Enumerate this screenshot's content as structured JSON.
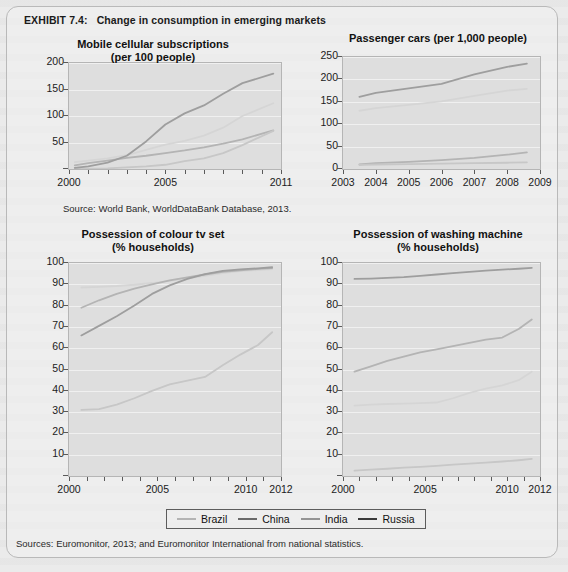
{
  "exhibit": {
    "number": "EXHIBIT 7.4:",
    "title": "Change in consumption in emerging markets"
  },
  "legend": {
    "items": [
      {
        "label": "Brazil",
        "color": "#b4b4b4"
      },
      {
        "label": "China",
        "color": "#6a6a6a"
      },
      {
        "label": "India",
        "color": "#949494"
      },
      {
        "label": "Russia",
        "color": "#3a3a3a"
      }
    ]
  },
  "sources": {
    "top": "Source: World Bank, WorldDataBank Database, 2013.",
    "bottom": "Sources: Euromonitor, 2013; and Euromonitor International from national statistics."
  },
  "chart_data": [
    {
      "id": "mobile-cellular-subscriptions",
      "type": "line",
      "title": "Mobile cellular subscriptions",
      "subtitle": "(per 100 people)",
      "xlabel": "",
      "ylabel": "",
      "xlim": [
        2000,
        2011
      ],
      "ylim": [
        0,
        200
      ],
      "yticks": [
        0,
        50,
        100,
        150,
        200
      ],
      "ytick_labels": [
        "",
        "50",
        "100",
        "150",
        "200"
      ],
      "xticks": [
        2000,
        2001,
        2002,
        2003,
        2004,
        2005,
        2006,
        2007,
        2008,
        2009,
        2010,
        2011
      ],
      "xtick_labels_shown": [
        "2000",
        "2005",
        "2011"
      ],
      "grid": true,
      "x": [
        2000.3,
        2001,
        2002,
        2003,
        2004,
        2005,
        2006,
        2007,
        2008,
        2009,
        2010.6
      ],
      "series": [
        {
          "name": "Brazil",
          "color": "#b4b4b4",
          "values": [
            13,
            16,
            20,
            26,
            36,
            46,
            53,
            63,
            78,
            100,
            124
          ]
        },
        {
          "name": "China",
          "color": "#6a6a6a",
          "values": [
            7,
            11,
            16,
            21,
            25,
            30,
            35,
            41,
            48,
            56,
            73
          ]
        },
        {
          "name": "India",
          "color": "#949494",
          "values": [
            0.4,
            0.6,
            1.2,
            3,
            5,
            8,
            15,
            20,
            30,
            45,
            72
          ]
        },
        {
          "name": "Russia",
          "color": "#3a3a3a",
          "values": [
            2,
            5,
            12,
            25,
            52,
            84,
            105,
            120,
            142,
            162,
            180
          ]
        }
      ]
    },
    {
      "id": "passenger-cars",
      "type": "line",
      "title": "Passenger cars (per 1,000 people)",
      "subtitle": "",
      "xlabel": "",
      "ylabel": "",
      "xlim": [
        2003,
        2009
      ],
      "ylim": [
        0,
        250
      ],
      "yticks": [
        0,
        50,
        100,
        150,
        200,
        250
      ],
      "ytick_labels": [
        "0",
        "50",
        "100",
        "150",
        "200",
        "250"
      ],
      "xticks": [
        2003,
        2004,
        2005,
        2006,
        2007,
        2008,
        2009
      ],
      "xtick_labels_shown": [
        "2003",
        "2004",
        "2005",
        "2006",
        "2007",
        "2008",
        "2009"
      ],
      "grid": true,
      "x": [
        2003.5,
        2004,
        2005,
        2006,
        2007,
        2008,
        2008.6
      ],
      "series": [
        {
          "name": "Brazil",
          "color": "#b4b4b4",
          "values": [
            130,
            136,
            143,
            151,
            163,
            175,
            179
          ]
        },
        {
          "name": "China",
          "color": "#6a6a6a",
          "values": [
            10,
            13,
            16,
            20,
            25,
            32,
            37
          ]
        },
        {
          "name": "India",
          "color": "#949494",
          "values": [
            9,
            10,
            11,
            12,
            13,
            14,
            15
          ]
        },
        {
          "name": "Russia",
          "color": "#3a3a3a",
          "values": [
            161,
            170,
            180,
            190,
            211,
            228,
            235
          ]
        }
      ]
    },
    {
      "id": "possession-colour-tv-set",
      "type": "line",
      "title": "Possession of colour tv set",
      "subtitle": "(% households)",
      "xlabel": "",
      "ylabel": "",
      "xlim": [
        2000,
        2012
      ],
      "ylim": [
        0,
        100
      ],
      "yticks": [
        0,
        10,
        20,
        30,
        40,
        50,
        60,
        70,
        80,
        90,
        100
      ],
      "ytick_labels": [
        "",
        "10",
        "20",
        "30",
        "40",
        "50",
        "60",
        "70",
        "80",
        "90",
        "100"
      ],
      "xticks": [
        2000,
        2001,
        2002,
        2003,
        2004,
        2005,
        2006,
        2007,
        2008,
        2009,
        2010,
        2011,
        2012
      ],
      "xtick_labels_shown": [
        "2000",
        "2005",
        "2010",
        "2012"
      ],
      "grid": true,
      "x": [
        2000.7,
        2001.7,
        2002.7,
        2003.7,
        2004.7,
        2005.7,
        2006.7,
        2007.7,
        2008.7,
        2009.7,
        2010.7,
        2011.5
      ],
      "series": [
        {
          "name": "Brazil",
          "color": "#b4b4b4",
          "values": [
            88.5,
            88.8,
            89.2,
            89.8,
            90.6,
            91.6,
            92.8,
            94,
            95.3,
            96.2,
            96.7,
            97.1
          ]
        },
        {
          "name": "China",
          "color": "#6a6a6a",
          "values": [
            79,
            82.5,
            85.5,
            88,
            90,
            91.8,
            93.3,
            94.6,
            95.8,
            96.6,
            97.2,
            97.6
          ]
        },
        {
          "name": "India",
          "color": "#949494",
          "values": [
            31,
            31.4,
            33.5,
            36.5,
            40,
            43,
            44.8,
            46.5,
            52,
            57,
            61.5,
            67.5
          ]
        },
        {
          "name": "Russia",
          "color": "#3a3a3a",
          "values": [
            66,
            70.5,
            75,
            80,
            85.5,
            89.5,
            92.5,
            94.8,
            96.3,
            97,
            97.5,
            98
          ]
        }
      ]
    },
    {
      "id": "possession-washing-machine",
      "type": "line",
      "title": "Possession of washing machine",
      "subtitle": "(% households)",
      "xlabel": "",
      "ylabel": "",
      "xlim": [
        2000,
        2012
      ],
      "ylim": [
        0,
        100
      ],
      "yticks": [
        0,
        10,
        20,
        30,
        40,
        50,
        60,
        70,
        80,
        90,
        100
      ],
      "ytick_labels": [
        "",
        "10",
        "20",
        "30",
        "40",
        "50",
        "60",
        "70",
        "80",
        "90",
        "100"
      ],
      "xticks": [
        2000,
        2001,
        2002,
        2003,
        2004,
        2005,
        2006,
        2007,
        2008,
        2009,
        2010,
        2011,
        2012
      ],
      "xtick_labels_shown": [
        "2000",
        "2005",
        "2010",
        "2012"
      ],
      "grid": true,
      "x": [
        2000.7,
        2001.7,
        2002.7,
        2003.7,
        2004.7,
        2005.7,
        2006.7,
        2007.7,
        2008.7,
        2009.7,
        2010.7,
        2011.5
      ],
      "series": [
        {
          "name": "Brazil",
          "color": "#b4b4b4",
          "values": [
            33,
            33.5,
            33.8,
            34,
            34.2,
            34.5,
            36.5,
            39,
            41,
            42.5,
            45,
            49
          ]
        },
        {
          "name": "China",
          "color": "#6a6a6a",
          "values": [
            49,
            51.5,
            54,
            56,
            58,
            59.5,
            61,
            62.5,
            64,
            65,
            69,
            73.5
          ]
        },
        {
          "name": "India",
          "color": "#949494",
          "values": [
            2.5,
            3,
            3.4,
            3.9,
            4.3,
            4.8,
            5.3,
            5.8,
            6.3,
            6.8,
            7.4,
            8
          ]
        },
        {
          "name": "Russia",
          "color": "#3a3a3a",
          "values": [
            92.5,
            92.7,
            93,
            93.4,
            94,
            94.6,
            95.2,
            95.8,
            96.4,
            96.9,
            97.3,
            97.7
          ]
        }
      ]
    }
  ]
}
